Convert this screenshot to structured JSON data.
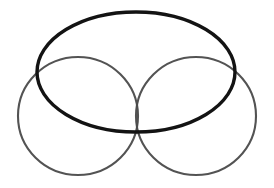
{
  "figure": {
    "background_color": "#ffffff",
    "width": 274,
    "height": 188
  },
  "shapes": [
    {
      "id": "left-circle",
      "name": "left-circle",
      "kind": "circle",
      "cx": 78,
      "cy": 116,
      "rx": 60,
      "ry": 59,
      "stroke_color": "#4a4a4a",
      "stroke_width": 2.1,
      "opacity": 0.95
    },
    {
      "id": "right-circle",
      "name": "right-circle",
      "kind": "circle",
      "cx": 196,
      "cy": 116,
      "rx": 60,
      "ry": 59,
      "stroke_color": "#4a4a4a",
      "stroke_width": 2.1,
      "opacity": 0.95
    },
    {
      "id": "large-ellipse",
      "name": "large-ellipse",
      "kind": "ellipse",
      "cx": 136,
      "cy": 72,
      "rx": 99,
      "ry": 60,
      "rotation": 0,
      "stroke_color": "#131313",
      "stroke_width": 3.4,
      "opacity": 1
    }
  ],
  "intersections": [
    {
      "name": "center-crossing",
      "x": 137,
      "y": 112
    },
    {
      "name": "left-upper-crossing",
      "x": 44,
      "y": 74
    },
    {
      "name": "right-upper-crossing",
      "x": 229,
      "y": 74
    }
  ],
  "labels": {
    "caption": ""
  }
}
